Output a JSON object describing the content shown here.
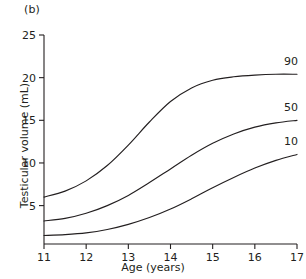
{
  "figure": {
    "panel_label": "(b)"
  },
  "chart_data": {
    "type": "line",
    "title": "",
    "panel": "(b)",
    "xlabel": "Age (years)",
    "ylabel": "Testicular volume (mL)",
    "xlim": [
      11,
      17
    ],
    "ylim": [
      0.5,
      25
    ],
    "xticks": [
      11,
      12,
      13,
      14,
      15,
      16,
      17
    ],
    "yticks": [
      5,
      10,
      15,
      20,
      25
    ],
    "xtick_labels": [
      "11",
      "12",
      "13",
      "14",
      "15",
      "16",
      "17"
    ],
    "ytick_labels": [
      "5",
      "10",
      "15",
      "20",
      "25"
    ],
    "grid": false,
    "legend_position": "right-inline-labels",
    "x": [
      11,
      11.5,
      12,
      12.5,
      13,
      13.5,
      14,
      14.5,
      15,
      15.5,
      16,
      16.5,
      17
    ],
    "series": [
      {
        "name": "90",
        "label": "90",
        "label_value": "90",
        "values": [
          6.0,
          6.7,
          7.9,
          9.7,
          12.1,
          14.8,
          17.2,
          18.8,
          19.7,
          20.1,
          20.3,
          20.4,
          20.4
        ]
      },
      {
        "name": "50",
        "label": "50",
        "label_value": "50",
        "values": [
          3.2,
          3.5,
          4.1,
          5.0,
          6.2,
          7.7,
          9.3,
          10.9,
          12.3,
          13.4,
          14.2,
          14.7,
          15.0
        ]
      },
      {
        "name": "10",
        "label": "10",
        "label_value": "10",
        "values": [
          1.5,
          1.6,
          1.8,
          2.2,
          2.8,
          3.6,
          4.6,
          5.8,
          7.1,
          8.3,
          9.4,
          10.3,
          11.0
        ]
      }
    ]
  }
}
